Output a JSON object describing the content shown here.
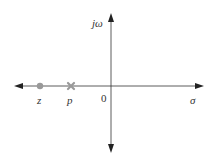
{
  "diagram": {
    "type": "pole-zero plot (s-plane)",
    "axes": {
      "horizontal_label": "σ",
      "vertical_label": "jω",
      "origin_label": "0"
    },
    "markers": [
      {
        "kind": "zero",
        "label": "z",
        "symbol": "circle",
        "color": "#999999"
      },
      {
        "kind": "pole",
        "label": "p",
        "symbol": "cross",
        "color": "#999999"
      }
    ],
    "colors": {
      "axis": "#333333",
      "marker": "#999999"
    }
  }
}
